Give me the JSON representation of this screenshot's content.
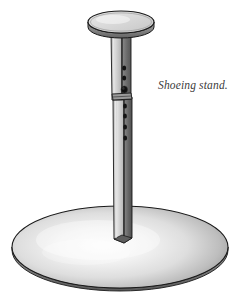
{
  "figure": {
    "caption": "Shoeing stand.",
    "background_color": "#ffffff",
    "icon_names": {
      "top_plate": "top-plate-disc-icon",
      "upper_tube": "upper-tube-icon",
      "lower_tube": "lower-tube-icon",
      "base_plate": "base-plate-ellipse-icon",
      "adjustment_holes": "adjustment-hole-icon",
      "pin_hole": "locking-pin-hole-icon",
      "collar": "telescoping-collar-icon"
    }
  },
  "colors": {
    "outline": "#1a1a1a",
    "metal_light": "#d9d9d9",
    "metal_mid": "#a8a8a8",
    "metal_dark": "#6e6e6e",
    "metal_darkest": "#4a4a4a",
    "plate_face": "#d7d7d7",
    "plate_rim": "#8c8c8c",
    "base_highlight": "#fbfbfb",
    "base_shadow": "#8f8f8f",
    "hole": "#141414",
    "caption_text": "#3b3b3b"
  },
  "geometry": {
    "canvas": {
      "width": 251,
      "height": 305
    },
    "top_plate": {
      "cx": 121,
      "cy": 22,
      "rx": 33,
      "ry": 11,
      "rim_depth": 5
    },
    "upper_tube": {
      "x_left": 111,
      "x_right": 131,
      "y_top": 30,
      "y_bottom": 99
    },
    "lower_tube": {
      "x_left": 113,
      "x_right": 132,
      "y_top": 97,
      "y_bottom": 239
    },
    "base_plate": {
      "cx": 120,
      "cy": 247,
      "rx": 108,
      "ry": 41,
      "thickness": 4
    },
    "upper_holes_y": [
      68,
      78
    ],
    "pin_hole": {
      "cy": 90,
      "r": 3.2
    },
    "lower_holes_y": [
      106,
      116,
      127,
      138
    ]
  },
  "caption_position": {
    "x": 158,
    "y": 78
  }
}
